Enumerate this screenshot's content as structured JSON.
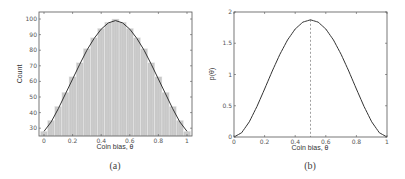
{
  "chart_data": [
    {
      "id": "a",
      "type": "bar",
      "caption": "(a)",
      "title": "",
      "xlabel": "Coin bias, θ",
      "ylabel": "Count",
      "xlim": [
        -0.035,
        1.035
      ],
      "ylim": [
        25,
        104.5
      ],
      "xticks": [
        0,
        0.2,
        0.4,
        0.6,
        0.8,
        1
      ],
      "xtick_labels": [
        "0",
        "0.2",
        "0.4",
        "0.6",
        "0.8",
        "1"
      ],
      "yticks": [
        30,
        40,
        50,
        60,
        70,
        80,
        90,
        100
      ],
      "ytick_labels": [
        "30",
        "40",
        "50",
        "60",
        "70",
        "80",
        "90",
        "100"
      ],
      "grid": false,
      "bar_width": 0.05,
      "categories": [
        0,
        0.05,
        0.1,
        0.15,
        0.2,
        0.25,
        0.3,
        0.35,
        0.4,
        0.45,
        0.5,
        0.55,
        0.6,
        0.65,
        0.7,
        0.75,
        0.8,
        0.85,
        0.9,
        0.95,
        1
      ],
      "values": [
        28,
        35,
        44,
        53,
        63,
        72,
        81,
        88,
        94,
        98,
        100,
        98,
        94,
        88,
        81,
        72,
        63,
        53,
        44,
        35,
        28
      ],
      "overlay_curve": {
        "description": "smooth fitted curve over histogram",
        "x": [
          0,
          0.05,
          0.1,
          0.15,
          0.2,
          0.25,
          0.3,
          0.35,
          0.4,
          0.45,
          0.5,
          0.55,
          0.6,
          0.65,
          0.7,
          0.75,
          0.8,
          0.85,
          0.9,
          0.95,
          1
        ],
        "y": [
          28,
          34,
          42.5,
          52,
          61.5,
          71,
          80,
          87.5,
          93.5,
          97.5,
          99,
          97.5,
          93.5,
          87.5,
          80,
          71,
          61.5,
          52,
          42.5,
          34,
          28
        ]
      },
      "colors": {
        "bar_fill": "#c8c8c8",
        "bar_edge": "#eeeeee",
        "curve": "#333333",
        "axis": "#555555"
      }
    },
    {
      "id": "b",
      "type": "line",
      "caption": "(b)",
      "title": "",
      "xlabel": "Coin bias, θ",
      "ylabel": "p(θ)",
      "xlim": [
        0,
        1
      ],
      "ylim": [
        0,
        2
      ],
      "xticks": [
        0,
        0.2,
        0.4,
        0.6,
        0.8,
        1
      ],
      "xtick_labels": [
        "0",
        "0.2",
        "0.4",
        "0.6",
        "0.8",
        "1"
      ],
      "yticks": [
        0,
        0.5,
        1,
        1.5,
        2
      ],
      "ytick_labels": [
        "0",
        "0.5",
        "1",
        "1.5",
        "2"
      ],
      "grid": false,
      "series": [
        {
          "name": "p(θ)",
          "x": [
            0,
            0.05,
            0.1,
            0.15,
            0.2,
            0.25,
            0.3,
            0.35,
            0.4,
            0.45,
            0.5,
            0.55,
            0.6,
            0.65,
            0.7,
            0.75,
            0.8,
            0.85,
            0.9,
            0.95,
            1
          ],
          "values": [
            0,
            0.068,
            0.243,
            0.488,
            0.768,
            1.055,
            1.323,
            1.553,
            1.728,
            1.838,
            1.875,
            1.838,
            1.728,
            1.553,
            1.323,
            1.055,
            0.768,
            0.488,
            0.243,
            0.068,
            0
          ]
        }
      ],
      "annotations": [
        {
          "type": "vline",
          "x": 0.5,
          "style": "dashed"
        }
      ],
      "colors": {
        "curve": "#333333",
        "vline": "#777777",
        "axis": "#555555"
      }
    }
  ],
  "layout": {
    "panels": [
      {
        "id": "a",
        "left": 39,
        "top": 12,
        "right": 192,
        "bottom": 136
      },
      {
        "id": "b",
        "left": 234,
        "top": 12,
        "right": 387,
        "bottom": 137
      }
    ]
  }
}
